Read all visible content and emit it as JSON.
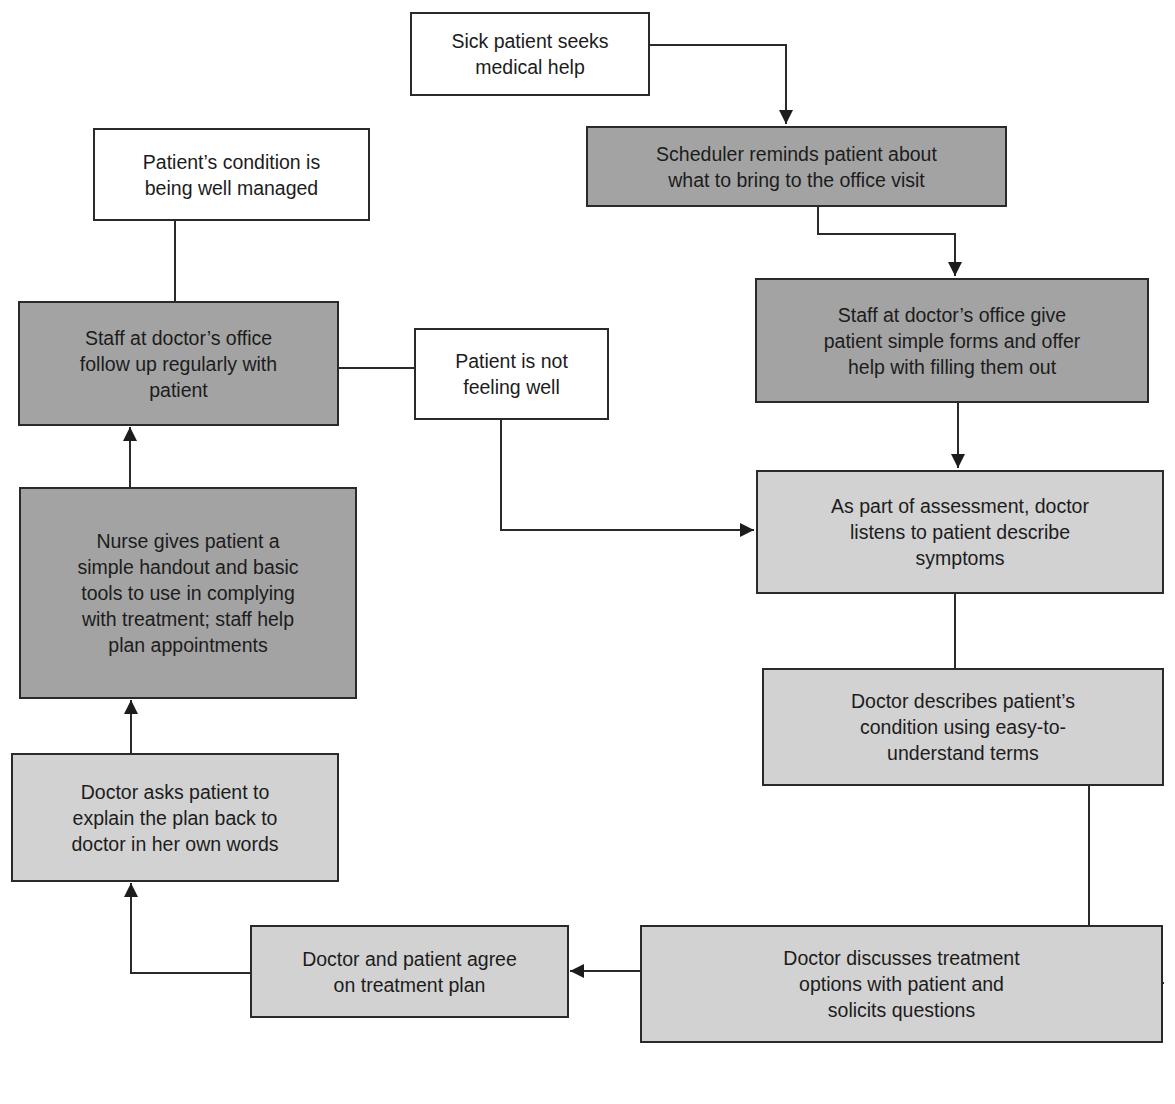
{
  "diagram": {
    "title": "",
    "colors": {
      "start_end_fill": "#ffffff",
      "staff_step_fill": "#a3a3a3",
      "doctor_step_fill": "#d2d2d2",
      "stroke": "#2a2a2a"
    },
    "nodes": {
      "sick_patient": {
        "label": "Sick patient seeks\nmedical help",
        "style": "white"
      },
      "scheduler": {
        "label": "Scheduler reminds patient about\nwhat to bring to the office visit",
        "style": "dark"
      },
      "staff_forms": {
        "label": "Staff at doctor’s office give\npatient simple forms and offer\nhelp with filling them out",
        "style": "dark"
      },
      "assessment": {
        "label": "As part of assessment, doctor\nlistens to patient describe\nsymptoms",
        "style": "light"
      },
      "describes_condition": {
        "label": "Doctor describes patient’s\ncondition using easy-to-\nunderstand terms",
        "style": "light"
      },
      "discusses_treatment": {
        "label": "Doctor discusses treatment\noptions with patient and\nsolicits questions",
        "style": "light"
      },
      "agree_plan": {
        "label": "Doctor and patient agree\non treatment plan",
        "style": "light"
      },
      "teach_back": {
        "label": "Doctor asks patient to\nexplain the plan back to\ndoctor in her own words",
        "style": "light"
      },
      "nurse_handout": {
        "label": "Nurse gives patient a\nsimple handout and basic\ntools to use in complying\nwith treatment; staff help\nplan appointments",
        "style": "dark"
      },
      "follow_up": {
        "label": "Staff at doctor’s office\nfollow up regularly with\npatient",
        "style": "dark"
      },
      "well_managed": {
        "label": "Patient’s condition is\nbeing well managed",
        "style": "white"
      },
      "not_feeling_well": {
        "label": "Patient is not\nfeeling well",
        "style": "white"
      }
    },
    "edges": [
      {
        "from": "sick_patient",
        "to": "scheduler",
        "arrow": true
      },
      {
        "from": "scheduler",
        "to": "staff_forms",
        "arrow": true
      },
      {
        "from": "staff_forms",
        "to": "assessment",
        "arrow": true
      },
      {
        "from": "assessment",
        "to": "describes_condition",
        "arrow": false
      },
      {
        "from": "describes_condition",
        "to": "discusses_treatment",
        "arrow": true
      },
      {
        "from": "discusses_treatment",
        "to": "agree_plan",
        "arrow": true
      },
      {
        "from": "agree_plan",
        "to": "teach_back",
        "arrow": true
      },
      {
        "from": "teach_back",
        "to": "nurse_handout",
        "arrow": true
      },
      {
        "from": "nurse_handout",
        "to": "follow_up",
        "arrow": true
      },
      {
        "from": "follow_up",
        "to": "well_managed",
        "arrow": false
      },
      {
        "from": "follow_up",
        "to": "not_feeling_well",
        "arrow": false
      },
      {
        "from": "not_feeling_well",
        "to": "assessment",
        "arrow": true
      }
    ]
  }
}
